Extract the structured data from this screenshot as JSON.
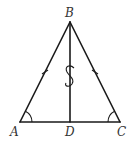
{
  "diagram": {
    "type": "isosceles triangle with median",
    "points": {
      "A": {
        "label": "A",
        "x": 20,
        "y": 122
      },
      "B": {
        "label": "B",
        "x": 70,
        "y": 22
      },
      "C": {
        "label": "C",
        "x": 120,
        "y": 122
      },
      "D": {
        "label": "D",
        "x": 70,
        "y": 122
      }
    },
    "segments": [
      "AB",
      "BC",
      "CA",
      "BD"
    ],
    "tick_marks": [
      "AB",
      "BC"
    ],
    "angle_marks": [
      "A",
      "C"
    ],
    "break_symbol": "S",
    "colors": {
      "stroke": "#1a1a1a",
      "label": "#333333"
    }
  }
}
